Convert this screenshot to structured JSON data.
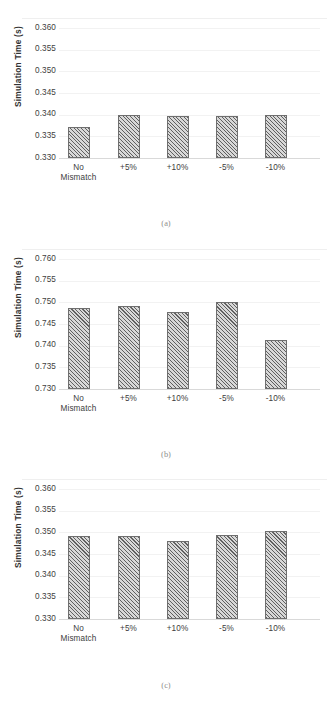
{
  "figure": {
    "panels": [
      {
        "caption": "(a)",
        "ylabel": "Simulation Time (s)",
        "yticks": [
          "0.360",
          "0.355",
          "0.350",
          "0.345",
          "0.340",
          "0.335",
          "0.330"
        ],
        "categories": [
          "No Mismatch",
          "+5%",
          "+10%",
          "-5%",
          "-10%"
        ]
      },
      {
        "caption": "(b)",
        "ylabel": "Simulation Time (s)",
        "yticks": [
          "0.760",
          "0.755",
          "0.750",
          "0.745",
          "0.740",
          "0.735",
          "0.730"
        ],
        "categories": [
          "No Mismatch",
          "+5%",
          "+10%",
          "-5%",
          "-10%"
        ]
      },
      {
        "caption": "(c)",
        "ylabel": "Simulation Time (s)",
        "yticks": [
          "0.360",
          "0.355",
          "0.350",
          "0.345",
          "0.340",
          "0.335",
          "0.330"
        ],
        "categories": [
          "No Mismatch",
          "+5%",
          "+10%",
          "-5%",
          "-10%"
        ]
      }
    ]
  },
  "chart_data": [
    {
      "type": "bar",
      "title": "(a)",
      "xlabel": "",
      "ylabel": "Simulation Time (s)",
      "categories": [
        "No Mismatch",
        "+5%",
        "+10%",
        "-5%",
        "-10%"
      ],
      "values": [
        0.3371,
        0.34,
        0.3397,
        0.3397,
        0.3399
      ],
      "ylim": [
        0.33,
        0.36
      ],
      "ytick_step": 0.005,
      "ytick_labels": [
        "0.330",
        "0.335",
        "0.340",
        "0.345",
        "0.350",
        "0.355",
        "0.360"
      ],
      "grid": true,
      "legend": "none",
      "bar_fill": "#d8d8d8",
      "bar_hatch": "diagonal-crosshatch",
      "bar_edge": "#6f6f6f"
    },
    {
      "type": "bar",
      "title": "(b)",
      "xlabel": "",
      "ylabel": "Simulation Time (s)",
      "categories": [
        "No Mismatch",
        "+5%",
        "+10%",
        "-5%",
        "-10%"
      ],
      "values": [
        0.7488,
        0.7491,
        0.7478,
        0.75,
        0.7414
      ],
      "ylim": [
        0.73,
        0.76
      ],
      "ytick_step": 0.005,
      "ytick_labels": [
        "0.730",
        "0.735",
        "0.740",
        "0.745",
        "0.750",
        "0.755",
        "0.760"
      ],
      "grid": true,
      "legend": "none",
      "bar_fill": "#d8d8d8",
      "bar_hatch": "diagonal-crosshatch",
      "bar_edge": "#6f6f6f"
    },
    {
      "type": "bar",
      "title": "(c)",
      "xlabel": "",
      "ylabel": "Simulation Time (s)",
      "categories": [
        "No Mismatch",
        "+5%",
        "+10%",
        "-5%",
        "-10%"
      ],
      "values": [
        0.3491,
        0.3492,
        0.348,
        0.3493,
        0.3503
      ],
      "ylim": [
        0.33,
        0.36
      ],
      "ytick_step": 0.005,
      "ytick_labels": [
        "0.330",
        "0.335",
        "0.340",
        "0.345",
        "0.350",
        "0.355",
        "0.360"
      ],
      "grid": true,
      "legend": "none",
      "bar_fill": "#d8d8d8",
      "bar_hatch": "diagonal-crosshatch",
      "bar_edge": "#6f6f6f"
    }
  ]
}
